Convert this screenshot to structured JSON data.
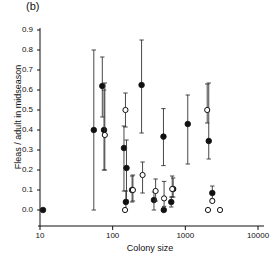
{
  "figure": {
    "panel_label": "(b)",
    "xlabel": "Colony size",
    "ylabel": "Fleas / adult in midseason"
  },
  "chart_data": {
    "type": "scatter",
    "title": "(b)",
    "xlabel": "Colony size",
    "ylabel": "Fleas / adult in midseason",
    "xscale": "log",
    "xlim": [
      10,
      10000
    ],
    "ylim": [
      0.0,
      0.9
    ],
    "xticks": [
      10,
      100,
      1000,
      10000
    ],
    "xtick_labels": [
      "10",
      "100",
      "1000",
      "10000"
    ],
    "yticks": [
      0.0,
      0.1,
      0.2,
      0.3,
      0.4,
      0.5,
      0.6,
      0.7,
      0.8,
      0.9
    ],
    "ytick_labels": [
      "0.0",
      "0.1",
      "0.2",
      "0.3",
      "0.4",
      "0.5",
      "0.6",
      "0.7",
      "0.8",
      "0.9"
    ],
    "grid": false,
    "legend": null,
    "error_bars": "vertical",
    "marker_styles": {
      "filled": "filled-circle",
      "open": "open-circle"
    },
    "series": [
      {
        "name": "filled",
        "marker": "filled-circle",
        "points": [
          {
            "x": 11,
            "y": 0.0,
            "yerr_low": 0.0,
            "yerr_high": 0.0
          },
          {
            "x": 55,
            "y": 0.4,
            "yerr_low": 0.4,
            "yerr_high": 0.4
          },
          {
            "x": 72,
            "y": 0.62,
            "yerr_low": 0.155,
            "yerr_high": 0.145
          },
          {
            "x": 76,
            "y": 0.4,
            "yerr_low": 0.2,
            "yerr_high": 0.2
          },
          {
            "x": 143,
            "y": 0.31,
            "yerr_low": 0.215,
            "yerr_high": 0.11
          },
          {
            "x": 155,
            "y": 0.21,
            "yerr_low": 0.16,
            "yerr_high": 0.14
          },
          {
            "x": 152,
            "y": 0.04,
            "yerr_low": 0.04,
            "yerr_high": 0.055
          },
          {
            "x": 185,
            "y": 0.1,
            "yerr_low": 0.06,
            "yerr_high": 0.07
          },
          {
            "x": 250,
            "y": 0.625,
            "yerr_low": 0.24,
            "yerr_high": 0.225
          },
          {
            "x": 370,
            "y": 0.05,
            "yerr_low": 0.05,
            "yerr_high": 0.04
          },
          {
            "x": 500,
            "y": 0.367,
            "yerr_low": 0.145,
            "yerr_high": 0.14
          },
          {
            "x": 505,
            "y": 0.0,
            "yerr_low": 0.0,
            "yerr_high": 0.0
          },
          {
            "x": 640,
            "y": 0.04,
            "yerr_low": 0.025,
            "yerr_high": 0.025
          },
          {
            "x": 680,
            "y": 0.105,
            "yerr_low": 0.04,
            "yerr_high": 0.055
          },
          {
            "x": 1080,
            "y": 0.43,
            "yerr_low": 0.2,
            "yerr_high": 0.145
          },
          {
            "x": 2100,
            "y": 0.345,
            "yerr_low": 0.09,
            "yerr_high": 0.29
          },
          {
            "x": 2350,
            "y": 0.085,
            "yerr_low": 0.03,
            "yerr_high": 0.035
          }
        ]
      },
      {
        "name": "open",
        "marker": "open-circle",
        "points": [
          {
            "x": 78,
            "y": 0.375,
            "yerr_low": 0.175,
            "yerr_high": 0.26
          },
          {
            "x": 150,
            "y": 0.5,
            "yerr_low": 0.085,
            "yerr_high": 0.085
          },
          {
            "x": 148,
            "y": 0.0,
            "yerr_low": 0.0,
            "yerr_high": 0.0
          },
          {
            "x": 190,
            "y": 0.1,
            "yerr_low": 0.055,
            "yerr_high": 0.075
          },
          {
            "x": 258,
            "y": 0.175,
            "yerr_low": 0.09,
            "yerr_high": 0.065
          },
          {
            "x": 390,
            "y": 0.095,
            "yerr_low": 0.05,
            "yerr_high": 0.06
          },
          {
            "x": 510,
            "y": 0.058,
            "yerr_low": 0.04,
            "yerr_high": 0.085
          },
          {
            "x": 660,
            "y": 0.105,
            "yerr_low": 0.04,
            "yerr_high": 0.065
          },
          {
            "x": 2000,
            "y": 0.5,
            "yerr_low": 0.065,
            "yerr_high": 0.13
          },
          {
            "x": 2050,
            "y": 0.0,
            "yerr_low": 0.0,
            "yerr_high": 0.0
          },
          {
            "x": 2350,
            "y": 0.045,
            "yerr_low": 0.0,
            "yerr_high": 0.0
          },
          {
            "x": 3000,
            "y": 0.0,
            "yerr_low": 0.0,
            "yerr_high": 0.0
          }
        ]
      }
    ]
  }
}
